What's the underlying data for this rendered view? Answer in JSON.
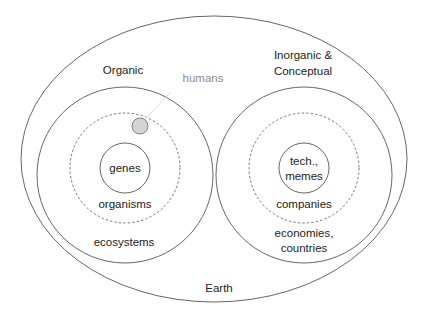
{
  "diagram": {
    "type": "nested-containment",
    "colors": {
      "stroke": "#555555",
      "text": "#222222",
      "highlight_fill": "#d4d4d4",
      "highlight_stroke": "#777777",
      "annotation_text": "#8a8a8a",
      "leader_line": "#d8d8d8"
    },
    "outer": {
      "label": "Earth"
    },
    "left": {
      "title": "Organic",
      "outer_ring_label": "ecosystems",
      "dashed_ring_label": "organisms",
      "core_label": "genes",
      "highlight_label": "humans"
    },
    "right": {
      "title_line1": "Inorganic &",
      "title_line2": "Conceptual",
      "outer_ring_label_line1": "economies,",
      "outer_ring_label_line2": "countries",
      "dashed_ring_label": "companies",
      "core_label_line1": "tech.,",
      "core_label_line2": "memes"
    }
  }
}
